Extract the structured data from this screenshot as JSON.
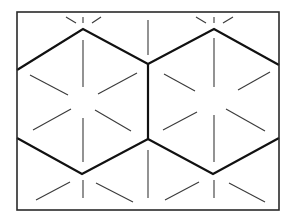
{
  "diagram": {
    "colors": {
      "background": "#ffffff",
      "frame": "#2a2a2a",
      "hex_edges": "#111111",
      "spokes": "#3a3a3a"
    },
    "frame": {
      "x1": 17,
      "y1": 12,
      "x2": 279,
      "y2": 210
    },
    "hex_edges": [
      [
        [
          17,
          70
        ],
        [
          83,
          29
        ],
        [
          148,
          64
        ],
        [
          214,
          29
        ],
        [
          279,
          65
        ]
      ],
      [
        [
          148,
          64
        ],
        [
          148,
          139
        ]
      ],
      [
        [
          17,
          138
        ],
        [
          82,
          174
        ],
        [
          148,
          139
        ],
        [
          213,
          174
        ],
        [
          279,
          138
        ]
      ]
    ],
    "spokes": [
      [
        [
          83,
          40
        ],
        [
          83,
          87
        ]
      ],
      [
        [
          83,
          118
        ],
        [
          83,
          162
        ]
      ],
      [
        [
          30,
          75
        ],
        [
          68,
          95
        ]
      ],
      [
        [
          98,
          94
        ],
        [
          137,
          73
        ]
      ],
      [
        [
          33,
          130
        ],
        [
          71,
          109
        ]
      ],
      [
        [
          95,
          110
        ],
        [
          131,
          131
        ]
      ],
      [
        [
          214,
          38
        ],
        [
          214,
          87
        ]
      ],
      [
        [
          214,
          115
        ],
        [
          214,
          162
        ]
      ],
      [
        [
          164,
          74
        ],
        [
          195,
          91
        ]
      ],
      [
        [
          238,
          90
        ],
        [
          270,
          72
        ]
      ],
      [
        [
          163,
          130
        ],
        [
          197,
          112
        ]
      ],
      [
        [
          226,
          109
        ],
        [
          265,
          131
        ]
      ],
      [
        [
          83,
          17
        ],
        [
          83,
          23
        ]
      ],
      [
        [
          66,
          17
        ],
        [
          76,
          23
        ]
      ],
      [
        [
          92,
          23
        ],
        [
          101,
          17
        ]
      ],
      [
        [
          214,
          17
        ],
        [
          214,
          23
        ]
      ],
      [
        [
          196,
          17
        ],
        [
          206,
          23
        ]
      ],
      [
        [
          223,
          23
        ],
        [
          233,
          17
        ]
      ],
      [
        [
          83,
          180
        ],
        [
          83,
          198
        ]
      ],
      [
        [
          36,
          200
        ],
        [
          70,
          182
        ]
      ],
      [
        [
          96,
          183
        ],
        [
          133,
          202
        ]
      ],
      [
        [
          214,
          180
        ],
        [
          214,
          198
        ]
      ],
      [
        [
          165,
          200
        ],
        [
          199,
          182
        ]
      ],
      [
        [
          229,
          183
        ],
        [
          265,
          202
        ]
      ],
      [
        [
          17,
          100
        ],
        [
          17,
          100
        ]
      ],
      [
        [
          148,
          20
        ],
        [
          148,
          55
        ]
      ],
      [
        [
          148,
          150
        ],
        [
          148,
          198
        ]
      ],
      [
        [
          60,
          215
        ],
        [
          60,
          215
        ]
      ]
    ]
  }
}
